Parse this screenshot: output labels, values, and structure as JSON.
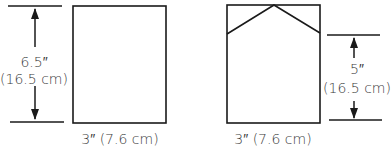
{
  "left_panel": {
    "height_label": "6.5″",
    "height_metric": "(16.5 cm)",
    "width_label": "3″ (7.6 cm)"
  },
  "right_panel": {
    "height_label": "5″",
    "height_metric": "(16.5 cm)",
    "width_label": "3″ (7.6 cm)"
  },
  "colors": {
    "stroke": "#1a1a1a",
    "text": "#3a3a3a"
  }
}
